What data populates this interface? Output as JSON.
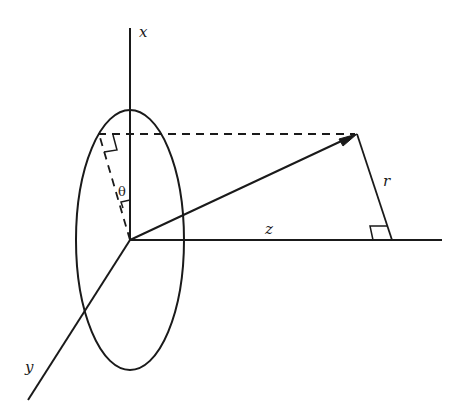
{
  "diagram": {
    "title": "",
    "labels": {
      "x_axis": "x",
      "y_axis": "y",
      "z_axis": "z",
      "radius": "r",
      "angle": "θ"
    },
    "colors": {
      "stroke": "#1a1a1a",
      "background": "#ffffff"
    }
  }
}
